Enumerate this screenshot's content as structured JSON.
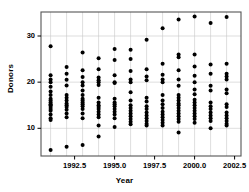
{
  "chart_data": {
    "type": "scatter",
    "title": "",
    "xlabel": "Year",
    "ylabel": "Donors",
    "xlim": [
      1990.4,
      2002.9
    ],
    "ylim": [
      4.0,
      35.2
    ],
    "xticks": [
      1992.5,
      1995.0,
      1997.5,
      2000.0,
      2002.5
    ],
    "xticklabels": [
      "1992.5",
      "1995.0",
      "1997.5",
      "2000.0",
      "2002.5"
    ],
    "yticks": [
      10,
      20,
      30
    ],
    "yticklabels": [
      "10",
      "20",
      "30"
    ],
    "grid": true,
    "grid_color": "#c8c8c8",
    "marker": "filled-circle",
    "marker_color": "#000000",
    "marker_size": 2.0,
    "frame_color": "#555555",
    "series": [
      {
        "name": "Donors by year",
        "points": [
          [
            1991,
            27.8
          ],
          [
            1991,
            21.5
          ],
          [
            1991,
            20.6
          ],
          [
            1991,
            20.0
          ],
          [
            1991,
            19.0
          ],
          [
            1991,
            18.0
          ],
          [
            1991,
            17.2
          ],
          [
            1991,
            16.4
          ],
          [
            1991,
            16.0
          ],
          [
            1991,
            15.6
          ],
          [
            1991,
            15.2
          ],
          [
            1991,
            15.0
          ],
          [
            1991,
            14.6
          ],
          [
            1991,
            14.2
          ],
          [
            1991,
            13.8
          ],
          [
            1991,
            13.0
          ],
          [
            1991,
            12.2
          ],
          [
            1991,
            11.8
          ],
          [
            1991,
            5.3
          ],
          [
            1992,
            23.3
          ],
          [
            1992,
            21.8
          ],
          [
            1992,
            20.5
          ],
          [
            1992,
            19.3
          ],
          [
            1992,
            17.2
          ],
          [
            1992,
            16.6
          ],
          [
            1992,
            16.0
          ],
          [
            1992,
            15.4
          ],
          [
            1992,
            15.0
          ],
          [
            1992,
            14.6
          ],
          [
            1992,
            14.0
          ],
          [
            1992,
            13.2
          ],
          [
            1992,
            12.4
          ],
          [
            1992,
            6.0
          ],
          [
            1993,
            26.4
          ],
          [
            1993,
            22.6
          ],
          [
            1993,
            21.1
          ],
          [
            1993,
            20.0
          ],
          [
            1993,
            19.3
          ],
          [
            1993,
            18.2
          ],
          [
            1993,
            17.2
          ],
          [
            1993,
            16.4
          ],
          [
            1993,
            16.0
          ],
          [
            1993,
            15.6
          ],
          [
            1993,
            15.2
          ],
          [
            1993,
            14.8
          ],
          [
            1993,
            14.2
          ],
          [
            1993,
            13.2
          ],
          [
            1993,
            12.2
          ],
          [
            1993,
            6.4
          ],
          [
            1994,
            25.2
          ],
          [
            1994,
            22.8
          ],
          [
            1994,
            21.0
          ],
          [
            1994,
            20.4
          ],
          [
            1994,
            20.0
          ],
          [
            1994,
            19.4
          ],
          [
            1994,
            16.6
          ],
          [
            1994,
            15.6
          ],
          [
            1994,
            15.0
          ],
          [
            1994,
            14.6
          ],
          [
            1994,
            14.2
          ],
          [
            1994,
            13.6
          ],
          [
            1994,
            13.0
          ],
          [
            1994,
            12.4
          ],
          [
            1994,
            10.6
          ],
          [
            1994,
            8.2
          ],
          [
            1995,
            27.2
          ],
          [
            1995,
            24.8
          ],
          [
            1995,
            21.5
          ],
          [
            1995,
            20.0
          ],
          [
            1995,
            19.8
          ],
          [
            1995,
            16.4
          ],
          [
            1995,
            15.6
          ],
          [
            1995,
            15.2
          ],
          [
            1995,
            14.8
          ],
          [
            1995,
            14.2
          ],
          [
            1995,
            13.6
          ],
          [
            1995,
            13.0
          ],
          [
            1995,
            12.2
          ],
          [
            1995,
            10.3
          ],
          [
            1996,
            27.0
          ],
          [
            1996,
            25.0
          ],
          [
            1996,
            22.4
          ],
          [
            1996,
            20.6
          ],
          [
            1996,
            20.0
          ],
          [
            1996,
            17.8
          ],
          [
            1996,
            16.0
          ],
          [
            1996,
            15.0
          ],
          [
            1996,
            14.4
          ],
          [
            1996,
            13.8
          ],
          [
            1996,
            13.2
          ],
          [
            1996,
            12.6
          ],
          [
            1996,
            12.0
          ],
          [
            1996,
            11.4
          ],
          [
            1996,
            10.9
          ],
          [
            1997,
            29.2
          ],
          [
            1997,
            22.8
          ],
          [
            1997,
            21.2
          ],
          [
            1997,
            20.4
          ],
          [
            1997,
            16.6
          ],
          [
            1997,
            15.8
          ],
          [
            1997,
            14.8
          ],
          [
            1997,
            14.2
          ],
          [
            1997,
            13.4
          ],
          [
            1997,
            12.8
          ],
          [
            1997,
            12.2
          ],
          [
            1997,
            11.6
          ],
          [
            1997,
            11.0
          ],
          [
            1997,
            10.6
          ],
          [
            1998,
            31.7
          ],
          [
            1998,
            24.0
          ],
          [
            1998,
            21.6
          ],
          [
            1998,
            20.6
          ],
          [
            1998,
            20.0
          ],
          [
            1998,
            17.2
          ],
          [
            1998,
            16.0
          ],
          [
            1998,
            15.2
          ],
          [
            1998,
            14.4
          ],
          [
            1998,
            13.6
          ],
          [
            1998,
            13.0
          ],
          [
            1998,
            12.4
          ],
          [
            1998,
            11.8
          ],
          [
            1998,
            11.2
          ],
          [
            1998,
            10.6
          ],
          [
            1999,
            33.6
          ],
          [
            1999,
            26.0
          ],
          [
            1999,
            25.4
          ],
          [
            1999,
            22.6
          ],
          [
            1999,
            20.6
          ],
          [
            1999,
            19.2
          ],
          [
            1999,
            17.2
          ],
          [
            1999,
            16.6
          ],
          [
            1999,
            16.0
          ],
          [
            1999,
            15.4
          ],
          [
            1999,
            15.0
          ],
          [
            1999,
            14.4
          ],
          [
            1999,
            13.8
          ],
          [
            1999,
            13.2
          ],
          [
            1999,
            12.6
          ],
          [
            1999,
            12.0
          ],
          [
            1999,
            11.4
          ],
          [
            1999,
            9.1
          ],
          [
            2000,
            34.2
          ],
          [
            2000,
            26.0
          ],
          [
            2000,
            23.4
          ],
          [
            2000,
            21.4
          ],
          [
            2000,
            20.0
          ],
          [
            2000,
            18.4
          ],
          [
            2000,
            17.4
          ],
          [
            2000,
            16.2
          ],
          [
            2000,
            15.6
          ],
          [
            2000,
            15.0
          ],
          [
            2000,
            14.4
          ],
          [
            2000,
            13.8
          ],
          [
            2000,
            13.2
          ],
          [
            2000,
            12.6
          ],
          [
            2000,
            12.0
          ],
          [
            2000,
            11.2
          ],
          [
            2001,
            32.8
          ],
          [
            2001,
            23.8
          ],
          [
            2001,
            21.8
          ],
          [
            2001,
            19.2
          ],
          [
            2001,
            18.2
          ],
          [
            2001,
            15.6
          ],
          [
            2001,
            14.8
          ],
          [
            2001,
            14.2
          ],
          [
            2001,
            13.4
          ],
          [
            2001,
            12.8
          ],
          [
            2001,
            12.2
          ],
          [
            2001,
            11.6
          ],
          [
            2001,
            10.0
          ],
          [
            2002,
            34.1
          ],
          [
            2002,
            24.0
          ],
          [
            2002,
            21.8
          ],
          [
            2002,
            21.2
          ],
          [
            2002,
            20.6
          ],
          [
            2002,
            18.4
          ],
          [
            2002,
            17.6
          ],
          [
            2002,
            15.2
          ],
          [
            2002,
            14.6
          ],
          [
            2002,
            13.4
          ],
          [
            2002,
            12.8
          ],
          [
            2002,
            12.2
          ],
          [
            2002,
            11.6
          ],
          [
            2002,
            11.0
          ],
          [
            2002,
            10.6
          ]
        ]
      }
    ]
  }
}
